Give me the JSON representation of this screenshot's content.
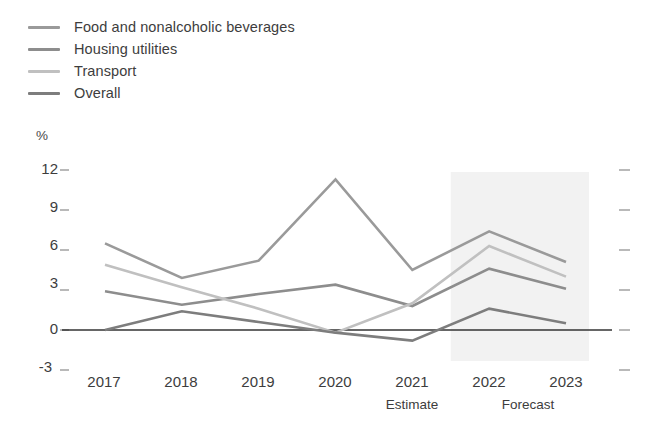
{
  "chart_data": {
    "type": "line",
    "title": "",
    "xlabel": "",
    "ylabel": "%",
    "ylim": [
      -3,
      12
    ],
    "yticks": [
      12,
      9,
      6,
      3,
      0,
      -3
    ],
    "ytick_labels": [
      "12",
      "9",
      "6",
      "3",
      "0",
      "-3"
    ],
    "grid": false,
    "legend_position": "top-left",
    "categories": [
      "2017",
      "2018",
      "2019",
      "2020",
      "2021",
      "2022",
      "2023"
    ],
    "x": [
      2017,
      2018,
      2019,
      2020,
      2021,
      2022,
      2023
    ],
    "zero_line": 0,
    "series": [
      {
        "name": "Food and nonalcoholic beverages",
        "color": "#9a9a9a",
        "values": [
          6.5,
          3.9,
          5.2,
          11.3,
          4.5,
          7.4,
          5.1
        ]
      },
      {
        "name": "Housing utilities",
        "color": "#8d8d8d",
        "values": [
          2.9,
          1.9,
          2.7,
          3.4,
          1.8,
          4.6,
          3.1
        ]
      },
      {
        "name": "Transport",
        "color": "#c0c0c0",
        "values": [
          4.9,
          3.2,
          1.6,
          -0.2,
          2.0,
          6.3,
          4.0
        ]
      },
      {
        "name": "Overall",
        "color": "#7d7d7d",
        "values": [
          0.0,
          1.4,
          0.6,
          -0.2,
          -0.8,
          1.6,
          0.5
        ]
      }
    ],
    "annotations": [
      {
        "name": "estimate",
        "label": "Estimate",
        "at": "2021"
      },
      {
        "name": "forecast",
        "label": "Forecast",
        "at": "2022-2023"
      }
    ],
    "shaded_region": {
      "name": "forecast-band",
      "from": 2021.5,
      "to": 2023.3,
      "color": "#f2f2f2"
    }
  },
  "legend": {
    "items": [
      {
        "label": "Food and nonalcoholic beverages",
        "color": "#9a9a9a"
      },
      {
        "label": "Housing utilities",
        "color": "#8d8d8d"
      },
      {
        "label": "Transport",
        "color": "#c0c0c0"
      },
      {
        "label": "Overall",
        "color": "#7d7d7d"
      }
    ]
  },
  "axes": {
    "y_unit": "%",
    "y_labels": [
      "12",
      "9",
      "6",
      "3",
      "0",
      "-3"
    ],
    "x_labels": [
      "2017",
      "2018",
      "2019",
      "2020",
      "2021",
      "2022",
      "2023"
    ],
    "x_sub_labels": [
      "Estimate",
      "Forecast"
    ]
  },
  "colors": {
    "axis_line": "#333333",
    "tick": "#9b9b9b",
    "text": "#3d3d3d",
    "shade": "#f2f2f2"
  }
}
